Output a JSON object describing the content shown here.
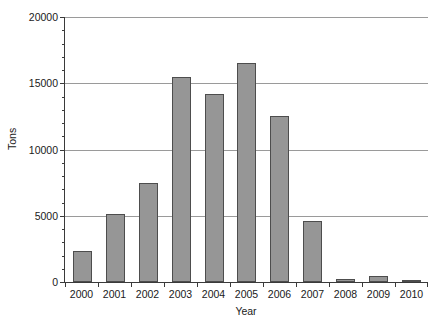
{
  "chart_data": {
    "type": "bar",
    "title": "",
    "xlabel": "Year",
    "ylabel": "Tons",
    "categories": [
      "2000",
      "2001",
      "2002",
      "2003",
      "2004",
      "2005",
      "2006",
      "2007",
      "2008",
      "2009",
      "2010"
    ],
    "values": [
      2330,
      5150,
      7500,
      15500,
      14200,
      16550,
      12550,
      4600,
      220,
      480,
      80
    ],
    "ylim": [
      0,
      20000
    ],
    "ytick_labels": [
      "0",
      "5000",
      "10000",
      "15000",
      "20000"
    ],
    "ytick_values": [
      0,
      5000,
      10000,
      15000,
      20000
    ],
    "yminor_interval": 1000,
    "grid": "horizontal",
    "legend": "none",
    "bar_fill": "#969696",
    "bar_stroke": "#4d4d4d",
    "grid_color": "#9a9a9a",
    "axis_color": "#3a3a3a",
    "background": "#ffffff"
  }
}
